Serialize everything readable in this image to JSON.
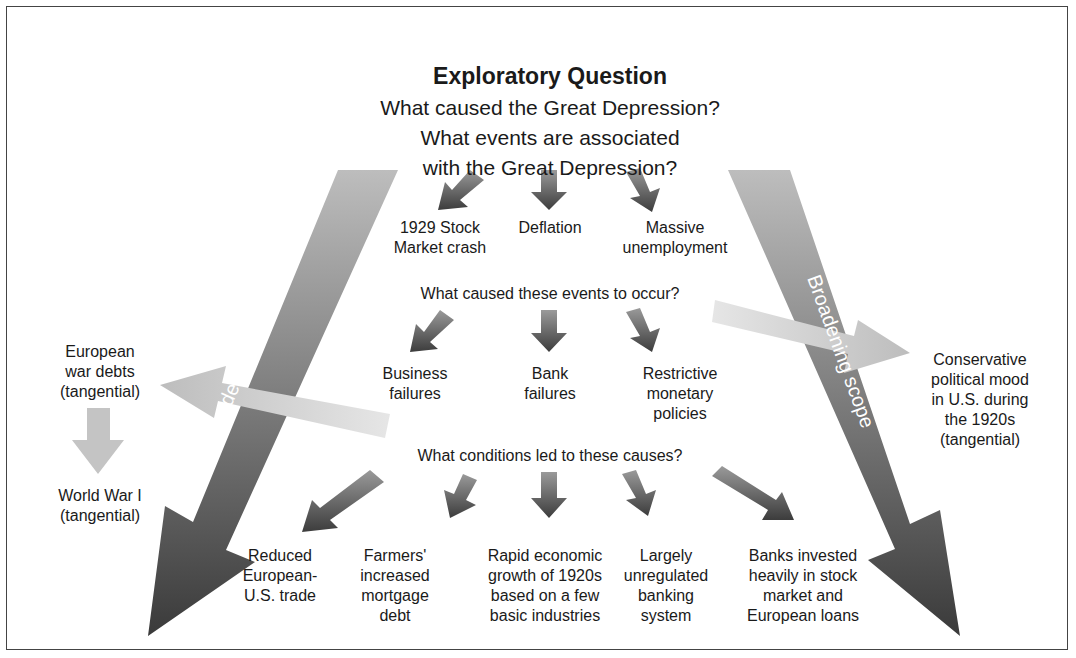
{
  "title": "Exploratory Question",
  "questions": [
    "What caused the Great Depression?",
    "What events are associated",
    "with the Great Depression?"
  ],
  "broadening_labels": {
    "left": "Broadening scope",
    "right": "Broadening scope"
  },
  "level1": {
    "items": [
      "1929 Stock\nMarket crash",
      "Deflation",
      "Massive\nunemployment"
    ]
  },
  "level2": {
    "question": "What caused these events to occur?",
    "items": [
      "Business\nfailures",
      "Bank\nfailures",
      "Restrictive\nmonetary\npolicies"
    ]
  },
  "level3": {
    "question": "What conditions led to these causes?",
    "items": [
      "Reduced\nEuropean-\nU.S. trade",
      "Farmers'\nincreased\nmortgage\ndebt",
      "Rapid economic\ngrowth of 1920s\nbased on a few\nbasic industries",
      "Largely\nunregulated\nbanking\nsystem",
      "Banks invested\nheavily in stock\nmarket and\nEuropean loans"
    ]
  },
  "tangential": {
    "left_top": "European\nwar debts\n(tangential)",
    "left_bottom": "World War I\n(tangential)",
    "right": "Conservative\npolitical mood\nin U.S. during\nthe 1920s\n(tangential)"
  },
  "colors": {
    "dark_arrow": "#4a4a4a",
    "light_arrow": "#c8c8c8",
    "border": "#444444"
  }
}
